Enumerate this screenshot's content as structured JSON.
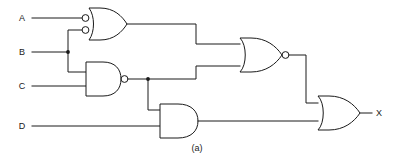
{
  "figure": {
    "caption": "(a)",
    "line_color": "#1a1a1a",
    "background_color": "#ffffff"
  },
  "inputs": [
    {
      "label": "A",
      "x": 22,
      "y": 18
    },
    {
      "label": "B",
      "x": 22,
      "y": 52
    },
    {
      "label": "C",
      "x": 22,
      "y": 86
    },
    {
      "label": "D",
      "x": 22,
      "y": 126
    }
  ],
  "outputs": [
    {
      "label": "X",
      "x": 379,
      "y": 110
    }
  ],
  "gates": [
    {
      "id": "gate1",
      "type": "negative-or",
      "label": "OR gate with inverted inputs",
      "inputs": [
        "A",
        "B"
      ],
      "output_net": "n1"
    },
    {
      "id": "gate2",
      "type": "nand",
      "label": "NAND gate",
      "inputs": [
        "B",
        "C"
      ],
      "output_net": "n2"
    },
    {
      "id": "gate3",
      "type": "nor",
      "label": "NOR gate",
      "inputs": [
        "n1",
        "n2"
      ],
      "output_net": "n3"
    },
    {
      "id": "gate4",
      "type": "and",
      "label": "AND gate",
      "inputs": [
        "n2",
        "D"
      ],
      "output_net": "n4"
    },
    {
      "id": "gate5",
      "type": "or",
      "label": "OR gate",
      "inputs": [
        "n3",
        "n4"
      ],
      "output_net": "X"
    }
  ],
  "junctions": [
    {
      "net": "B",
      "x": 68,
      "y": 52
    },
    {
      "net": "n2",
      "x": 148,
      "y": 77
    }
  ]
}
